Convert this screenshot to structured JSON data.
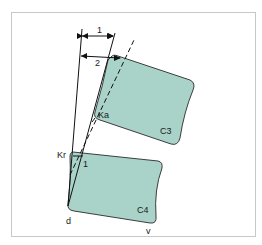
{
  "diagram": {
    "colors": {
      "vertebra_fill": "#a9d2c8",
      "vertebra_stroke": "#2a2a2a",
      "line": "#111111",
      "frame": "#c8c8c8"
    },
    "labels": {
      "arrow_1": "1",
      "arrow_2": "2",
      "ka": "Ka",
      "kr": "Kr",
      "angle_1": "1",
      "c3": "C3",
      "c4": "C4",
      "d": "d",
      "v": "v"
    },
    "vertebrae": [
      {
        "name": "C3",
        "label": "C3"
      },
      {
        "name": "C4",
        "label": "C4"
      }
    ],
    "measurements": [
      {
        "id": "1",
        "description": "horizontal distance arrow 1"
      },
      {
        "id": "2",
        "description": "horizontal distance arrow 2"
      }
    ]
  }
}
